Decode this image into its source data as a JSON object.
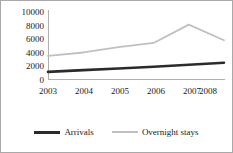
{
  "chart_data": {
    "type": "line",
    "title": "",
    "xlabel": "",
    "ylabel": "",
    "categories": [
      "2003",
      "2004",
      "2005",
      "2006",
      "2007",
      "2008"
    ],
    "x": [
      2003,
      2004,
      2005,
      2006,
      2007,
      2008
    ],
    "series": [
      {
        "name": "Arrivals",
        "color": "#2b2b2b",
        "values": [
          1050,
          1300,
          1550,
          1800,
          2100,
          2400
        ]
      },
      {
        "name": "Overnight stays",
        "color": "#c0c0c0",
        "values": [
          3400,
          3900,
          4700,
          5300,
          8000,
          5700
        ]
      }
    ],
    "ylim": [
      0,
      10000
    ],
    "yticks": [
      "0",
      "2000",
      "4000",
      "6000",
      "8000",
      "10000"
    ],
    "ytick_values": [
      0,
      2000,
      4000,
      6000,
      8000,
      10000
    ],
    "xticks": [
      "2003",
      "2004",
      "2005",
      "2006",
      "2007",
      "2008"
    ],
    "grid": false,
    "legend_position": "bottom"
  },
  "legend": {
    "entries": [
      {
        "label": "Arrivals"
      },
      {
        "label": "Overnight stays"
      }
    ]
  },
  "colors": {
    "arrivals": "#2b2b2b",
    "overnight_stays": "#c0c0c0",
    "axis": "#b0b0b0",
    "border": "#a9a9a9",
    "background": "#ffffff",
    "text": "#1a1a1a"
  }
}
